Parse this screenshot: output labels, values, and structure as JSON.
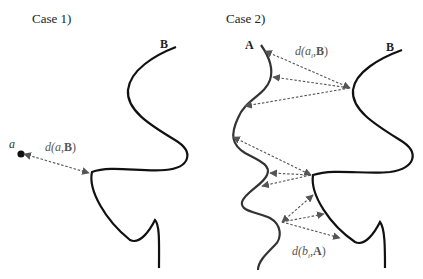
{
  "case1": {
    "title": "Case 1)",
    "curve_label": "B",
    "point_label": "a",
    "distance_label": {
      "fn": "d(",
      "arg1": "a",
      "sep": ",",
      "arg2": "B",
      "close": ")"
    }
  },
  "case2": {
    "title": "Case 2)",
    "curve_a_label": "A",
    "curve_b_label": "B",
    "distance_a_to_b": {
      "fn": "d(",
      "arg1": "a",
      "sub": "i",
      "sep": ",",
      "arg2": "B",
      "close": ")"
    },
    "distance_b_to_a": {
      "fn": "d(",
      "arg1": "b",
      "sub": "i",
      "sep": ",",
      "arg2": "A",
      "close": ")"
    }
  },
  "colors": {
    "curve": "#111111",
    "arrow": "#555555",
    "label": "#222222"
  }
}
